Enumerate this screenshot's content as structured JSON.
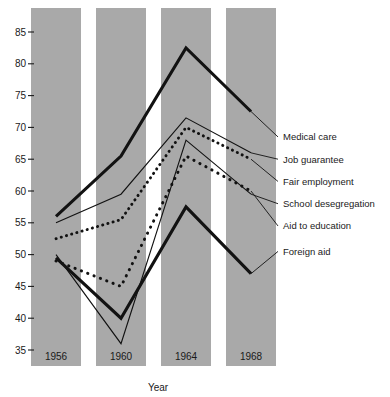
{
  "chart_data": {
    "type": "line",
    "title": "",
    "xlabel": "Year",
    "ylabel": "",
    "categories": [
      "1956",
      "1960",
      "1964",
      "1968"
    ],
    "x": [
      1956,
      1960,
      1964,
      1968
    ],
    "ylim": [
      32,
      88
    ],
    "xlim": [
      1954.5,
      1969.5
    ],
    "yticks": [
      35,
      40,
      45,
      50,
      55,
      60,
      65,
      70,
      75,
      80,
      85
    ],
    "grid": false,
    "legend_position": "right-outside",
    "series": [
      {
        "name": "Medical care",
        "style": "thick-solid",
        "values": [
          56.0,
          65.5,
          82.5,
          72.5
        ],
        "label_y": 68.5
      },
      {
        "name": "Job guarantee",
        "style": "thin-solid",
        "values": [
          55.0,
          59.5,
          71.5,
          66.0
        ],
        "label_y": 65.0
      },
      {
        "name": "Fair employment",
        "style": "fine-dotted",
        "values": [
          52.5,
          55.5,
          70.0,
          65.0
        ],
        "label_y": 61.5
      },
      {
        "name": "School desegregation",
        "style": "thin-solid",
        "values": [
          50.0,
          36.0,
          68.0,
          59.5
        ],
        "label_y": 58.0
      },
      {
        "name": "Aid to education",
        "style": "coarse-dotted",
        "values": [
          49.0,
          45.0,
          65.5,
          60.0
        ],
        "label_y": 54.5
      },
      {
        "name": "Foreign aid",
        "style": "thick-solid",
        "values": [
          49.5,
          40.0,
          57.5,
          47.0
        ],
        "label_y": 50.5
      }
    ]
  },
  "colors": {
    "band": "#a9a9a9",
    "ink": "#121212",
    "background": "#ffffff"
  }
}
